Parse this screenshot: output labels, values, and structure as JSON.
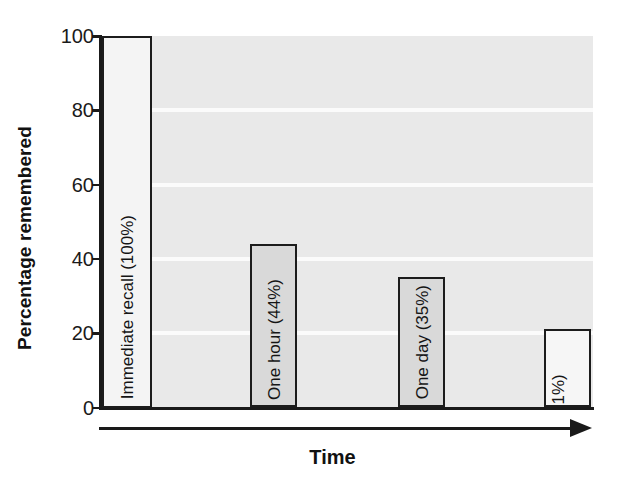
{
  "chart_data": {
    "type": "bar",
    "title": "",
    "subtitle": "",
    "xlabel": "Time",
    "ylabel": "Percentage remembered",
    "ylim": [
      0,
      100
    ],
    "yticks": [
      0,
      20,
      40,
      60,
      80,
      100
    ],
    "ytick_labels": [
      "0",
      "20",
      "40",
      "60",
      "80",
      "100"
    ],
    "grid": true,
    "legend": null,
    "categories": [
      "Immediate recall",
      "One hour",
      "One day",
      "One week"
    ],
    "values": [
      100,
      44,
      35,
      21
    ],
    "bar_labels": [
      "Immediate recall (100%)",
      "One hour (44%)",
      "One day (35%)",
      "One week (21%)"
    ],
    "bars": [
      {
        "category": "Immediate recall",
        "value": 100,
        "label_lines": [
          "Immediate recall (100%)"
        ],
        "fill": "#f4f4f4",
        "stroke": "#1c1c1c",
        "x": 102,
        "width": 50
      },
      {
        "category": "One hour",
        "value": 44,
        "label_lines": [
          "One hour (44%)"
        ],
        "fill": "#d9d9d9",
        "stroke": "#1c1c1c",
        "x": 250,
        "width": 47
      },
      {
        "category": "One day",
        "value": 35,
        "label_lines": [
          "One day (35%)"
        ],
        "fill": "#d9d9d9",
        "stroke": "#1c1c1c",
        "x": 398,
        "width": 47
      },
      {
        "category": "One week",
        "value": 21,
        "label_lines": [
          "One week",
          "(21%)"
        ],
        "fill": "#f6f6f6",
        "stroke": "#1c1c1c",
        "x": 544,
        "width": 47
      }
    ],
    "colors": {
      "plot_background": "#e9e9e9",
      "gridline": "#fbfbfb",
      "axis": "#1a1a1a",
      "text": "#1a1a1a",
      "page_background": "#ffffff"
    }
  }
}
